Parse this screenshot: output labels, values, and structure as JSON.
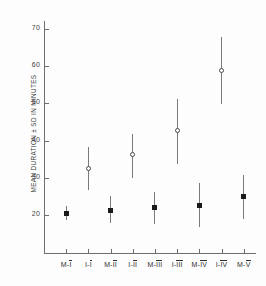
{
  "chart_data": {
    "type": "scatter",
    "title": "",
    "xlabel": "",
    "ylabel": "MEAN DURATION ± SD IN MINUTES",
    "ylim": [
      12,
      74
    ],
    "yticks": [
      20,
      30,
      40,
      50,
      60,
      70
    ],
    "grid": false,
    "legend": null,
    "categories": [
      "M-I",
      "I-I",
      "M-II",
      "I-II",
      "M-III",
      "I-III",
      "M-IV",
      "I-IV",
      "M-V"
    ],
    "category_parts": [
      {
        "prefix": "M-",
        "numeral": "I"
      },
      {
        "prefix": "I-",
        "numeral": "I"
      },
      {
        "prefix": "M-",
        "numeral": "II"
      },
      {
        "prefix": "I-",
        "numeral": "II"
      },
      {
        "prefix": "M-",
        "numeral": "III"
      },
      {
        "prefix": "I-",
        "numeral": "III"
      },
      {
        "prefix": "M-",
        "numeral": "IV"
      },
      {
        "prefix": "I-",
        "numeral": "IV"
      },
      {
        "prefix": "M-",
        "numeral": "V"
      }
    ],
    "series": [
      {
        "name": "mean ± SD",
        "values": [
          20.4,
          32.6,
          21.2,
          36.2,
          22.1,
          42.6,
          22.5,
          58.8,
          24.9
        ],
        "errors_low": [
          18.6,
          26.7,
          17.9,
          30.0,
          17.7,
          33.8,
          16.7,
          49.8,
          19.0
        ],
        "errors_high": [
          22.3,
          38.4,
          25.1,
          41.9,
          26.3,
          51.3,
          28.5,
          67.9,
          30.7
        ],
        "markers": [
          "square",
          "circle",
          "square",
          "circle",
          "square",
          "circle",
          "square",
          "circle",
          "square"
        ]
      }
    ]
  },
  "colors": {
    "axis": "#6e6e6e",
    "marker_filled": "#1a1a1a",
    "marker_open": "#4a4a4a",
    "errorbar": "#7a7a7a",
    "text": "#3d3d3d",
    "background": "#fdfdfd"
  }
}
